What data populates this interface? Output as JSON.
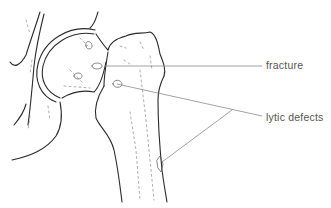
{
  "figure": {
    "annotations": [
      {
        "id": "fracture",
        "label": "fracture"
      },
      {
        "id": "lytic-defects",
        "label": "lytic defects"
      }
    ],
    "colors": {
      "line": "#2a2a2a",
      "leader": "#8a8a8a",
      "label": "#555555",
      "background": "#ffffff"
    }
  }
}
